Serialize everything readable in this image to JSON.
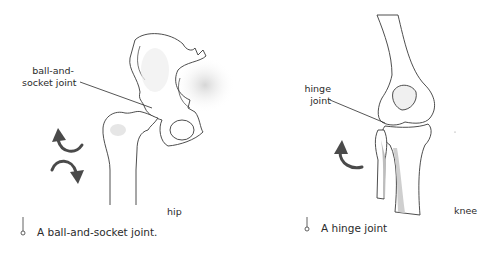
{
  "panels": [
    {
      "id": "hip",
      "labels": {
        "joint_line1": "ball-and-",
        "joint_line2": "socket joint",
        "region": "hip"
      },
      "caption": "A ball-and-socket joint.",
      "arrows": [
        "counter-clockwise",
        "clockwise"
      ]
    },
    {
      "id": "knee",
      "labels": {
        "joint_line1": "hinge",
        "joint_line2": "joint",
        "region": "knee"
      },
      "caption": "A hinge joint",
      "arrows": [
        "counter-clockwise"
      ]
    }
  ],
  "colors": {
    "outline": "#3a3a3a",
    "bone_fill": "#ffffff",
    "shade": "#d9d9d9",
    "arrow": "#4a4a4a",
    "text": "#2b2b2b"
  }
}
